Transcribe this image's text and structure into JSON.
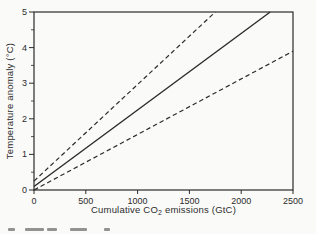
{
  "figure": {
    "background": "#fafaf8",
    "ink_color": "#2b2b2b",
    "text_color": "#2c2c2c"
  },
  "chart_data": {
    "type": "line",
    "title": "",
    "xlabel": "Cumulative CO2 emissions (GtC)",
    "xlabel_parts": {
      "pre": "Cumulative CO",
      "sub": "2",
      "post": " emissions (GtC)"
    },
    "ylabel": "Temperature anomaly (°C)",
    "xlim": [
      0,
      2500
    ],
    "ylim": [
      0,
      5
    ],
    "xtick_labels": [
      "0",
      "500",
      "1000",
      "1500",
      "2000",
      "2500"
    ],
    "xticks": [
      0,
      500,
      1000,
      1500,
      2000,
      2500
    ],
    "ytick_labels": [
      "0",
      "1",
      "2",
      "3",
      "4",
      "5"
    ],
    "yticks": [
      0,
      1,
      2,
      3,
      4,
      5
    ],
    "y_minor_ticks": [
      0.5,
      1.5,
      2.5,
      3.5,
      4.5
    ],
    "grid": false,
    "legend_position": "none",
    "series": [
      {
        "name": "upper uncertainty bound",
        "line_style": "dashed",
        "slope_degC_per_1000GtC": 2.7,
        "points": [
          [
            0,
            0.25
          ],
          [
            1750,
            5.0
          ]
        ]
      },
      {
        "name": "best estimate",
        "line_style": "solid",
        "slope_degC_per_1000GtC": 2.15,
        "points": [
          [
            0,
            0.1
          ],
          [
            2280,
            5.0
          ]
        ]
      },
      {
        "name": "lower uncertainty bound",
        "line_style": "dashed",
        "slope_degC_per_1000GtC": 1.56,
        "points": [
          [
            0,
            0.0
          ],
          [
            2500,
            3.9
          ]
        ]
      }
    ]
  }
}
